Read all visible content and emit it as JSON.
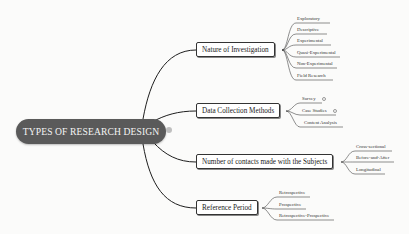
{
  "central": {
    "label": "TYPES OF RESEARCH DESIGN",
    "color": "#5a5a5a",
    "text_color": "#f4f4f4"
  },
  "branches": [
    {
      "label": "Nature of Investigation",
      "leaves": [
        "Exploratory",
        "Descriptive",
        "Experimental",
        "Quasi-Experimental",
        "Non-Experimental",
        "Field Research"
      ]
    },
    {
      "label": "Data Collection Methods",
      "leaves": [
        "Survey",
        "Case Studies",
        "Content Analysis"
      ]
    },
    {
      "label": "Number of contacts made with the Subjects",
      "leaves": [
        "Cross-sectional",
        "Before-and-After",
        "Longitudinal"
      ]
    },
    {
      "label": "Reference Period",
      "leaves": [
        "Retrospective",
        "Prospective",
        "Retrospective-Prospective"
      ]
    }
  ]
}
